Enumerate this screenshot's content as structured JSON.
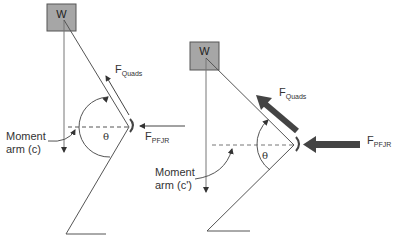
{
  "left_diagram": {
    "weight_label": "W",
    "quads_label": {
      "main": "F",
      "sub": "Quads"
    },
    "pfjr_label": {
      "main": "F",
      "sub": "PFJR"
    },
    "angle_label": "θ",
    "moment_arm_label": [
      "Moment",
      "arm (c)"
    ]
  },
  "right_diagram": {
    "weight_label": "W",
    "quads_label": {
      "main": "F",
      "sub": "Quads"
    },
    "pfjr_label": {
      "main": "F",
      "sub": "PFJR"
    },
    "angle_label": "θ",
    "moment_arm_label": [
      "Moment",
      "arm (c')"
    ]
  },
  "colors": {
    "box_fill": "#a6a6a6",
    "line": "#555555",
    "thick_arrow": "#444444"
  }
}
